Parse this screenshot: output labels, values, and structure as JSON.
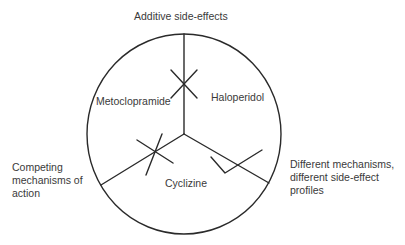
{
  "diagram": {
    "type": "pie-segmented-circle",
    "labels": {
      "top_annotation": "Additive side-effects",
      "left_annotation": "Competing\nmechanisms of\naction",
      "right_annotation": "Different mechanisms,\ndifferent side-effect\nprofiles"
    },
    "segments": [
      {
        "name": "Metoclopramide"
      },
      {
        "name": "Haloperidol"
      },
      {
        "name": "Cyclizine"
      }
    ],
    "marks": [
      {
        "boundary": "Metoclopramide-Haloperidol",
        "symbol": "cross"
      },
      {
        "boundary": "Metoclopramide-Cyclizine",
        "symbol": "cross"
      },
      {
        "boundary": "Haloperidol-Cyclizine",
        "symbol": "check"
      }
    ],
    "colors": {
      "stroke": "#2a2a2a",
      "text": "#3a3a3a",
      "background": "#ffffff"
    }
  }
}
